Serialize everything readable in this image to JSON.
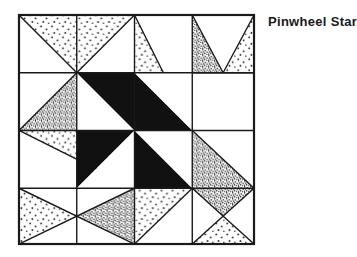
{
  "figure": {
    "title": "Pinwheel Star",
    "kind": "quilt-block-diagram",
    "frame": {
      "x": 17,
      "y": 13,
      "width": 239,
      "height": 233
    },
    "grid": {
      "rows": 4,
      "cols": 4
    },
    "colors": {
      "outline": "#1a1a1a",
      "background": "#ffffff",
      "solid_dark": "#111111",
      "dot_light": "#333333",
      "dot_dark": "#222222",
      "title": "#1a1a1a"
    },
    "fills": {
      "white": "none",
      "light_dot": "sparse round dot stipple",
      "dark_dot": "dense fine stipple",
      "solid": "solid black"
    },
    "patches": [
      {
        "id": "tl-a",
        "cell": [
          0,
          0
        ],
        "shape": "triangle-top",
        "fill": "light_dot"
      },
      {
        "id": "tl-b",
        "cell": [
          0,
          0
        ],
        "shape": "triangle-left",
        "fill": "white"
      },
      {
        "id": "tl-c",
        "cell": [
          0,
          0
        ],
        "shape": "triangle-right",
        "fill": "white"
      },
      {
        "id": "tl-d",
        "cell": [
          0,
          0
        ],
        "shape": "triangle-bottom",
        "fill": "dark_dot"
      },
      {
        "id": "t1",
        "cell": [
          0,
          1
        ],
        "shape": "square",
        "fill": "white"
      },
      {
        "id": "t2a",
        "cell": [
          0,
          2
        ],
        "shape": "half-tl",
        "fill": "light_dot"
      },
      {
        "id": "t2b",
        "cell": [
          0,
          2
        ],
        "shape": "half-br",
        "fill": "white"
      },
      {
        "id": "tr-a",
        "cell": [
          0,
          3
        ],
        "shape": "triangle-top",
        "fill": "white"
      },
      {
        "id": "tr-b",
        "cell": [
          0,
          3
        ],
        "shape": "triangle-left",
        "fill": "dark_dot"
      },
      {
        "id": "tr-c",
        "cell": [
          0,
          3
        ],
        "shape": "triangle-right",
        "fill": "light_dot"
      },
      {
        "id": "tr-d",
        "cell": [
          0,
          3
        ],
        "shape": "triangle-bottom",
        "fill": "white"
      },
      {
        "id": "l1a",
        "cell": [
          1,
          0
        ],
        "shape": "half-tr",
        "fill": "light_dot"
      },
      {
        "id": "l1b",
        "cell": [
          1,
          0
        ],
        "shape": "half-bl",
        "fill": "white"
      },
      {
        "id": "c-tl-a",
        "cell": [
          1,
          1
        ],
        "shape": "half-tr",
        "fill": "solid"
      },
      {
        "id": "c-tl-b",
        "cell": [
          1,
          1
        ],
        "shape": "half-bl",
        "fill": "white"
      },
      {
        "id": "c-tr-a",
        "cell": [
          1,
          2
        ],
        "shape": "half-bl",
        "fill": "solid"
      },
      {
        "id": "c-tr-b",
        "cell": [
          1,
          2
        ],
        "shape": "half-tr",
        "fill": "white"
      },
      {
        "id": "r1",
        "cell": [
          1,
          3
        ],
        "shape": "square",
        "fill": "white"
      },
      {
        "id": "l2",
        "cell": [
          2,
          0
        ],
        "shape": "square",
        "fill": "white"
      },
      {
        "id": "c-bl-a",
        "cell": [
          2,
          1
        ],
        "shape": "half-tl",
        "fill": "solid"
      },
      {
        "id": "c-bl-b",
        "cell": [
          2,
          1
        ],
        "shape": "half-br",
        "fill": "white"
      },
      {
        "id": "c-br-a",
        "cell": [
          2,
          2
        ],
        "shape": "half-br",
        "fill": "solid"
      },
      {
        "id": "c-br-b",
        "cell": [
          2,
          2
        ],
        "shape": "half-tl",
        "fill": "white"
      },
      {
        "id": "r2a",
        "cell": [
          2,
          3
        ],
        "shape": "half-bl",
        "fill": "dark_dot"
      },
      {
        "id": "r2b",
        "cell": [
          2,
          3
        ],
        "shape": "half-tr",
        "fill": "white"
      },
      {
        "id": "bl-a",
        "cell": [
          3,
          0
        ],
        "shape": "triangle-top",
        "fill": "white"
      },
      {
        "id": "bl-b",
        "cell": [
          3,
          0
        ],
        "shape": "triangle-left",
        "fill": "light_dot"
      },
      {
        "id": "bl-c",
        "cell": [
          3,
          0
        ],
        "shape": "triangle-right",
        "fill": "dark_dot"
      },
      {
        "id": "bl-d",
        "cell": [
          3,
          0
        ],
        "shape": "triangle-bottom",
        "fill": "white"
      },
      {
        "id": "b1a",
        "cell": [
          3,
          1
        ],
        "shape": "half-tl",
        "fill": "light_dot"
      },
      {
        "id": "b1b",
        "cell": [
          3,
          1
        ],
        "shape": "half-br",
        "fill": "white"
      },
      {
        "id": "b2",
        "cell": [
          3,
          2
        ],
        "shape": "square",
        "fill": "white"
      },
      {
        "id": "br-a",
        "cell": [
          3,
          3
        ],
        "shape": "triangle-top",
        "fill": "dark_dot"
      },
      {
        "id": "br-b",
        "cell": [
          3,
          3
        ],
        "shape": "triangle-left",
        "fill": "white"
      },
      {
        "id": "br-c",
        "cell": [
          3,
          3
        ],
        "shape": "triangle-right",
        "fill": "white"
      },
      {
        "id": "br-d",
        "cell": [
          3,
          3
        ],
        "shape": "triangle-bottom",
        "fill": "light_dot"
      }
    ]
  }
}
